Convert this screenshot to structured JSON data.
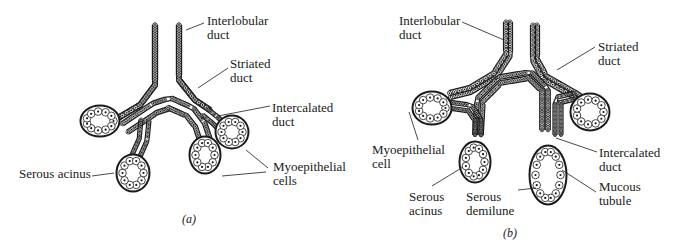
{
  "figure": {
    "panels": [
      {
        "id": "a",
        "caption": "(a)",
        "labels": {
          "interlobular": [
            "Interlobular",
            "duct"
          ],
          "striated": [
            "Striated",
            "duct"
          ],
          "intercalated": [
            "Intercalated",
            "duct"
          ],
          "serous_acinus": [
            "Serous acinus"
          ],
          "myoepithelial": [
            "Myoepithelial",
            "cells"
          ]
        }
      },
      {
        "id": "b",
        "caption": "(b)",
        "labels": {
          "interlobular": [
            "Interlobular",
            "duct"
          ],
          "striated": [
            "Striated",
            "duct"
          ],
          "myoepithelial": [
            "Myoepithelial",
            "cell"
          ],
          "intercalated": [
            "Intercalated",
            "duct"
          ],
          "serous_acinus": [
            "Serous",
            "acinus"
          ],
          "serous_demilune": [
            "Serous",
            "demilune"
          ],
          "mucous_tubule": [
            "Mucous",
            "tubule"
          ]
        }
      }
    ]
  }
}
